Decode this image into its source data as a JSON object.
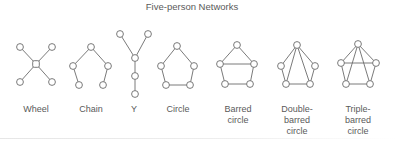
{
  "title": "Five-person Networks",
  "styles": {
    "stroke": "#6b6b6b",
    "node_fill": "#ffffff",
    "text": "#5a5a5a"
  },
  "networks": [
    {
      "id": "wheel",
      "label": "Wheel",
      "label_lines": [
        "Wheel"
      ],
      "label_x": 36,
      "nodes": [
        [
          20,
          47
        ],
        [
          52,
          47
        ],
        [
          36,
          64
        ],
        [
          20,
          82
        ],
        [
          52,
          82
        ]
      ],
      "center_square": 2,
      "edges": [
        [
          0,
          2
        ],
        [
          1,
          2
        ],
        [
          3,
          2
        ],
        [
          4,
          2
        ]
      ]
    },
    {
      "id": "chain",
      "label": "Chain",
      "label_lines": [
        "Chain"
      ],
      "label_x": 91,
      "nodes": [
        [
          91,
          47
        ],
        [
          73,
          66
        ],
        [
          108,
          66
        ],
        [
          79,
          85
        ],
        [
          103,
          85
        ]
      ],
      "edges": [
        [
          0,
          1
        ],
        [
          0,
          2
        ],
        [
          1,
          3
        ],
        [
          2,
          4
        ]
      ]
    },
    {
      "id": "y",
      "label": "Y",
      "label_lines": [
        "Y"
      ],
      "label_x": 134,
      "nodes": [
        [
          120,
          34
        ],
        [
          148,
          34
        ],
        [
          135,
          58
        ],
        [
          135,
          76
        ],
        [
          135,
          94
        ]
      ],
      "edges": [
        [
          0,
          2
        ],
        [
          1,
          2
        ],
        [
          2,
          3
        ],
        [
          3,
          4
        ]
      ]
    },
    {
      "id": "circle",
      "label": "Circle",
      "label_lines": [
        "Circle"
      ],
      "label_x": 178,
      "nodes": [
        [
          177,
          46
        ],
        [
          161,
          66
        ],
        [
          194,
          66
        ],
        [
          166,
          85
        ],
        [
          190,
          85
        ]
      ],
      "edges": [
        [
          0,
          1
        ],
        [
          0,
          2
        ],
        [
          1,
          3
        ],
        [
          2,
          4
        ],
        [
          3,
          4
        ]
      ]
    },
    {
      "id": "barred-circle",
      "label": "Barred circle",
      "label_lines": [
        "Barred",
        "circle"
      ],
      "label_x": 238,
      "nodes": [
        [
          237,
          45
        ],
        [
          220,
          64
        ],
        [
          254,
          64
        ],
        [
          225,
          84
        ],
        [
          250,
          84
        ]
      ],
      "edges": [
        [
          0,
          1
        ],
        [
          0,
          2
        ],
        [
          1,
          3
        ],
        [
          2,
          4
        ],
        [
          3,
          4
        ],
        [
          1,
          2
        ]
      ]
    },
    {
      "id": "double-barred-circle",
      "label": "Double-barred circle",
      "label_lines": [
        "Double-",
        "barred",
        "circle"
      ],
      "label_x": 297,
      "nodes": [
        [
          297,
          45
        ],
        [
          281,
          66
        ],
        [
          315,
          66
        ],
        [
          286,
          84
        ],
        [
          310,
          84
        ]
      ],
      "edges": [
        [
          0,
          1
        ],
        [
          0,
          2
        ],
        [
          1,
          3
        ],
        [
          2,
          4
        ],
        [
          3,
          4
        ],
        [
          0,
          3
        ],
        [
          0,
          4
        ]
      ]
    },
    {
      "id": "triple-barred-circle",
      "label": "Triple-barred circle",
      "label_lines": [
        "Triple-",
        "barred",
        "circle"
      ],
      "label_x": 358,
      "nodes": [
        [
          358,
          44
        ],
        [
          341,
          63
        ],
        [
          376,
          63
        ],
        [
          346,
          84
        ],
        [
          370,
          84
        ]
      ],
      "edges": [
        [
          0,
          1
        ],
        [
          0,
          2
        ],
        [
          1,
          3
        ],
        [
          2,
          4
        ],
        [
          3,
          4
        ],
        [
          1,
          2
        ],
        [
          0,
          3
        ],
        [
          0,
          4
        ]
      ]
    }
  ]
}
